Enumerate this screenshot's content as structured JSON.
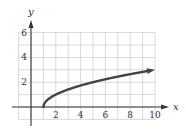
{
  "chart_data": {
    "type": "line",
    "title": "",
    "xlabel": "x",
    "ylabel": "y",
    "function": "y = sqrt(x - 1)",
    "xlim": [
      -1,
      10
    ],
    "ylim": [
      -1,
      6
    ],
    "grid": true,
    "x_ticks": [
      2,
      4,
      6,
      8,
      10
    ],
    "y_ticks": [
      2,
      4,
      6
    ],
    "series": [
      {
        "name": "curve",
        "color": "#444444",
        "x": [
          1,
          1.25,
          1.5,
          2,
          3,
          4,
          5,
          6,
          7,
          8,
          9,
          10
        ],
        "y": [
          0,
          0.5,
          0.71,
          1,
          1.41,
          1.73,
          2,
          2.24,
          2.45,
          2.65,
          2.83,
          3
        ],
        "end_arrow": true
      }
    ],
    "colors": {
      "grid": "#cfcfcf",
      "axis": "#333333",
      "curve": "#444444"
    }
  }
}
